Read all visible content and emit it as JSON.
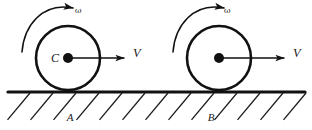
{
  "figure": {
    "background_color": "#ffffff",
    "ink_color": "#111111",
    "width": 312,
    "height": 130
  },
  "ground": {
    "label": "ground-surface",
    "line_y": 92,
    "x_start": 8,
    "x_end": 305,
    "thickness": 3.2,
    "hatch": {
      "count": 13,
      "spacing": 23,
      "first_x": 30,
      "length": 35,
      "angle_deg": 50,
      "direction": "down-left"
    }
  },
  "wheels": [
    {
      "id": "wheel-left",
      "cx": 68,
      "cy": 58,
      "r": 32,
      "center_label": "C",
      "has_center_label": true,
      "contact_label": "A",
      "contact_label_x": 70,
      "contact_label_y": 121,
      "velocity_label": "V",
      "velocity_label_x": 133,
      "velocity_label_y": 57,
      "velocity_arrow": {
        "x1": 68,
        "y1": 58,
        "x2": 124,
        "y2": 58
      },
      "omega_label": "ω",
      "omega_label_x": 75,
      "omega_label_y": 13,
      "spin_direction": "counterclockwise"
    },
    {
      "id": "wheel-right",
      "cx": 219,
      "cy": 58,
      "r": 32,
      "center_label": "",
      "has_center_label": false,
      "contact_label": "B",
      "contact_label_x": 211,
      "contact_label_y": 121,
      "velocity_label": "V",
      "velocity_label_x": 293,
      "velocity_label_y": 57,
      "velocity_arrow": {
        "x1": 219,
        "y1": 58,
        "x2": 284,
        "y2": 58
      },
      "omega_label": "ω",
      "omega_label_x": 224,
      "omega_label_y": 13,
      "spin_direction": "counterclockwise"
    }
  ],
  "annotations": {
    "omega_symbol_name": "angular-velocity-omega",
    "velocity_symbol_name": "linear-velocity-v",
    "center_symbol_name": "center-of-mass-c",
    "contact_point_names": [
      "contact-point-a",
      "contact-point-b"
    ]
  }
}
